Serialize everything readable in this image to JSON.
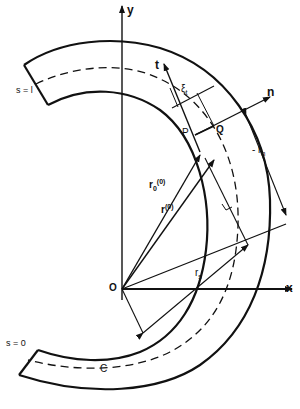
{
  "figure": {
    "type": "curved beam geometry diagram",
    "labels": {
      "y_axis": "y",
      "x_axis": "x",
      "origin": "O",
      "s_end": "s = l",
      "s_start": "s = 0",
      "centerline": "C",
      "tangent": "t",
      "normal": "n",
      "point_p": "P",
      "point_q": "Q",
      "r0": "r",
      "r0_sub": "0",
      "r0_sup": "(0)",
      "r": "r",
      "r_sup": "(0)",
      "xi": "ξ",
      "xi_sub": "t",
      "rn": "- r",
      "rn_sub": "n",
      "rs": "r",
      "rs_sub": "s"
    },
    "colors": {
      "ink": "#111111",
      "background": "#ffffff"
    }
  }
}
